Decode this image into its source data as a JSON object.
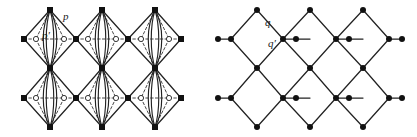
{
  "figure": {
    "background_color": "#ffffff",
    "line_color": "#222222",
    "node_fill_solid": "#111111",
    "node_fill_open": "#ffffff",
    "width": 417,
    "height": 137
  },
  "panels": [
    {
      "id": "left-panel",
      "name": "bundled-diamond-lattice",
      "labels": [
        {
          "id": "p",
          "text": "p",
          "x": 63,
          "y": 11,
          "edge": "upper-right-dashed-diagonal"
        },
        {
          "id": "pp",
          "text": "p′",
          "x": 42,
          "y": 30,
          "edge": "inner-curved-bundle"
        }
      ],
      "geometry": {
        "apex_x": [
          50,
          102,
          155
        ],
        "apex_y_top": 10,
        "apex_y_mid": 68,
        "apex_y_bottom": 127,
        "side_y_upper": 39,
        "side_y_lower": 98,
        "side_x": [
          24,
          76,
          128,
          181
        ],
        "open_circle_dx": 14,
        "bundle_curve_count": 4
      }
    },
    {
      "id": "right-panel",
      "name": "simple-diamond-lattice",
      "labels": [
        {
          "id": "q",
          "text": "q",
          "x": 265,
          "y": 17,
          "edge": "upper-right-diagonal"
        },
        {
          "id": "qp",
          "text": "q′",
          "x": 268,
          "y": 38,
          "edge": "horizontal-edge"
        }
      ],
      "geometry": {
        "apex_x": [
          257,
          310,
          363
        ],
        "apex_y_top": 10,
        "apex_y_mid": 68,
        "apex_y_bottom": 127,
        "side_y_upper": 39,
        "side_y_lower": 98,
        "side_x": [
          231,
          283,
          336,
          389
        ],
        "mid_dot_dx": 13
      }
    }
  ]
}
